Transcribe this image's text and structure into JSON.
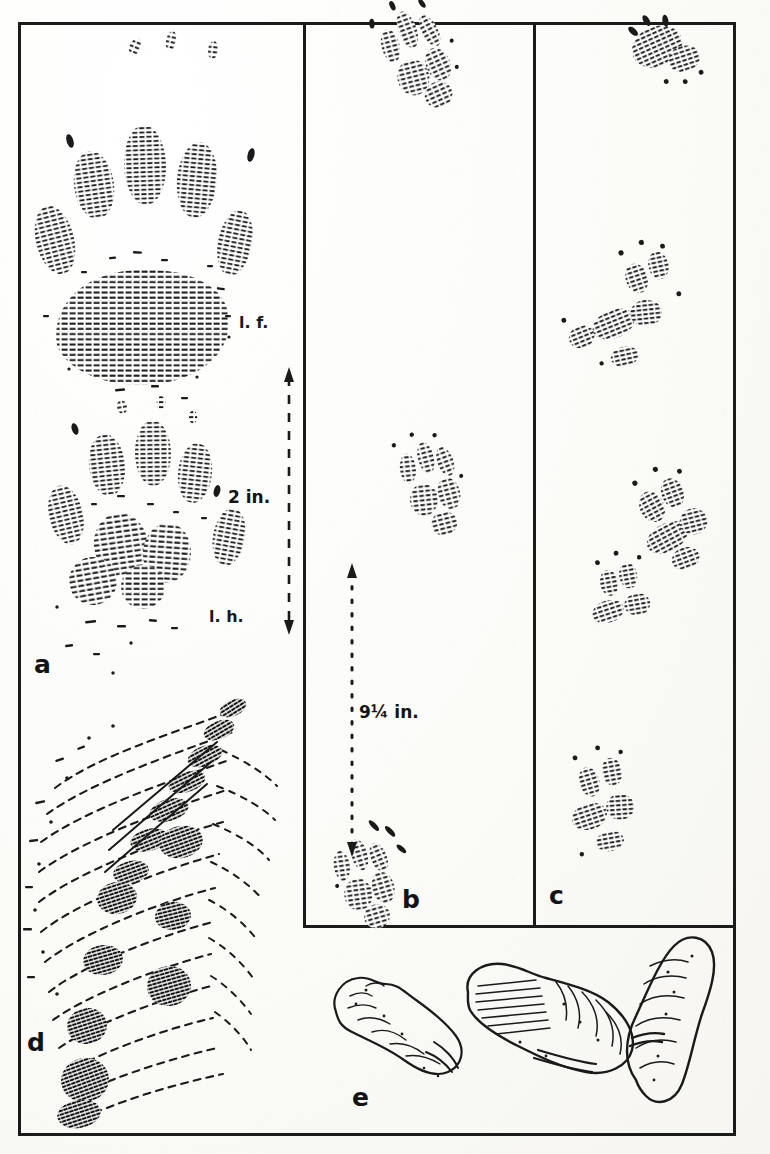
{
  "plate": {
    "kind": "field-guide-track-plate",
    "paper_color": "#fbfbf8",
    "ink_color": "#1a1a1a",
    "panels": [
      {
        "id": "a",
        "label": "a",
        "content": "paired fore and hind paw prints in a trail, five toes each, with size callout"
      },
      {
        "id": "b",
        "label": "b",
        "content": "three widely-spaced track groups in a trail with stride callout"
      },
      {
        "id": "c",
        "label": "c",
        "content": "four loosely-spaced track groups in a bounding trail"
      },
      {
        "id": "d",
        "label": "d",
        "content": "large detailed single track engraving in soft mud"
      },
      {
        "id": "e",
        "label": "e",
        "content": "three scat specimens drawn in line engraving"
      }
    ],
    "annotations": {
      "left_fore": "l. f.",
      "left_hind": "l. h.",
      "measure_a": "2 in.",
      "measure_b": "9¼ in."
    }
  }
}
